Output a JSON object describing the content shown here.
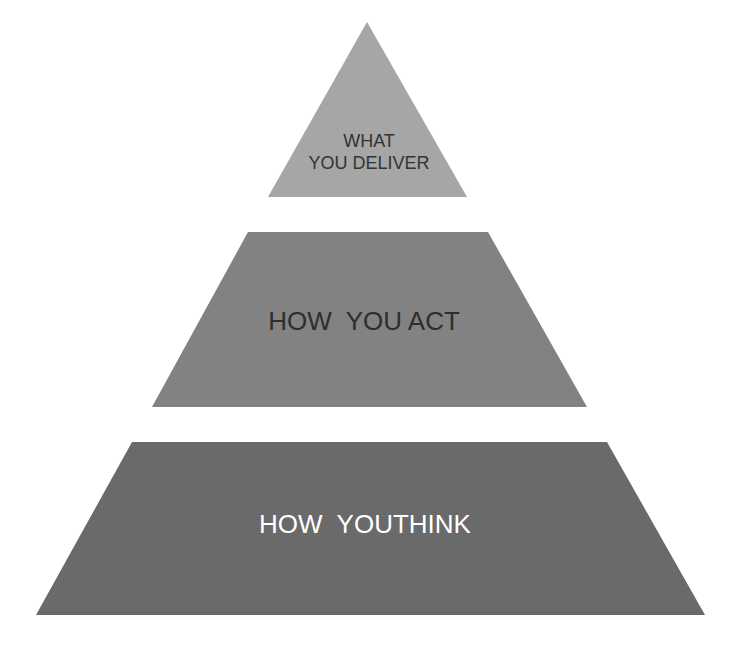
{
  "diagram": {
    "type": "pyramid",
    "levels": [
      {
        "id": "top",
        "lines": [
          "WHAT",
          "YOU DELIVER"
        ],
        "fill": "#a6a6a6",
        "text_color": "#333333",
        "points": "367,22 467,197 268,197"
      },
      {
        "id": "middle",
        "lines": [
          "HOW  YOU ACT"
        ],
        "fill": "#828282",
        "text_color": "#2e2e2e",
        "points": "248,232 488,232 587,407 152,407"
      },
      {
        "id": "bottom",
        "lines": [
          "HOW  YOUTHINK"
        ],
        "fill": "#6a6a6a",
        "text_color": "#ffffff",
        "points": "132,442 607,442 705,615 36,615"
      }
    ]
  }
}
